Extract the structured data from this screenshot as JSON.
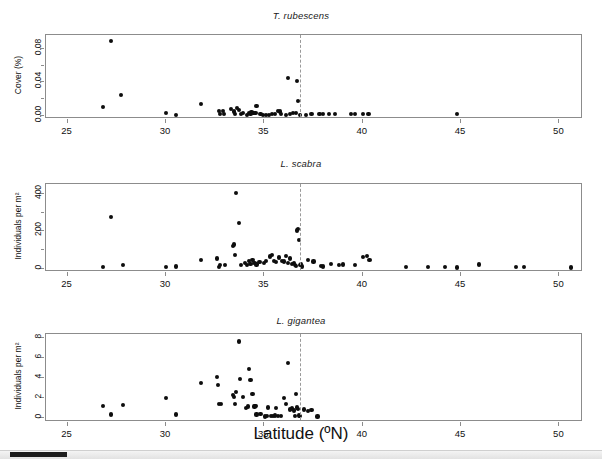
{
  "figure": {
    "xaxis_title": "Latitude (ºN)",
    "dashed_line_color": "#9a9a9a",
    "point_color": "#0d0d0d",
    "frame_color": "#8c8c8c",
    "background": "#ffffff"
  },
  "scrollbar": {
    "name": "horizontal-scrollbar",
    "thumb_color": "#1c1c1c",
    "track_color": "#e2e2e2"
  },
  "chart_data": [
    {
      "type": "scatter",
      "title": "T. rubescens",
      "xlabel": "Latitude (ºN)",
      "ylabel": "Cover (%)",
      "xlim": [
        23.9,
        51.2
      ],
      "ylim": [
        -0.004,
        0.097
      ],
      "xticks": [
        25,
        30,
        35,
        40,
        45,
        50
      ],
      "xticklabels": [
        "25",
        "30",
        "35",
        "40",
        "45",
        "50"
      ],
      "yticks": [
        0.0,
        0.02,
        0.04,
        0.06,
        0.08
      ],
      "yticklabels": [
        "0.00",
        "",
        "0.04",
        "",
        "0.08"
      ],
      "grid": false,
      "legend": "none",
      "annotations": [
        {
          "type": "vline",
          "x": 36.8,
          "style": "dashed",
          "color": "#9a9a9a"
        }
      ],
      "points": [
        [
          26.8,
          0.01
        ],
        [
          27.2,
          0.09
        ],
        [
          27.7,
          0.025
        ],
        [
          30.0,
          0.003
        ],
        [
          30.5,
          0.001
        ],
        [
          31.8,
          0.014
        ],
        [
          32.7,
          0.006
        ],
        [
          32.75,
          0.002
        ],
        [
          32.9,
          0.006
        ],
        [
          32.95,
          0.002
        ],
        [
          33.3,
          0.008
        ],
        [
          33.45,
          0.005
        ],
        [
          33.5,
          0.002
        ],
        [
          33.6,
          0.009
        ],
        [
          33.7,
          0.007
        ],
        [
          33.8,
          0.002
        ],
        [
          33.9,
          0.003
        ],
        [
          34.1,
          0.001
        ],
        [
          34.2,
          0.003
        ],
        [
          34.3,
          0.002
        ],
        [
          34.35,
          0.004
        ],
        [
          34.45,
          0.003
        ],
        [
          34.55,
          0.003
        ],
        [
          34.6,
          0.012
        ],
        [
          34.8,
          0.002
        ],
        [
          34.95,
          0.001
        ],
        [
          35.1,
          0.001
        ],
        [
          35.25,
          0.001
        ],
        [
          35.4,
          0.002
        ],
        [
          35.55,
          0.002
        ],
        [
          35.7,
          0.006
        ],
        [
          35.8,
          0.005
        ],
        [
          35.85,
          0.002
        ],
        [
          36.1,
          0.001
        ],
        [
          36.2,
          0.045
        ],
        [
          36.3,
          0.002
        ],
        [
          36.45,
          0.003
        ],
        [
          36.6,
          0.003
        ],
        [
          36.65,
          0.042
        ],
        [
          36.7,
          0.018
        ],
        [
          36.8,
          0.001
        ],
        [
          37.1,
          0.001
        ],
        [
          37.4,
          0.002
        ],
        [
          37.8,
          0.002
        ],
        [
          38.0,
          0.002
        ],
        [
          38.3,
          0.002
        ],
        [
          38.6,
          0.002
        ],
        [
          39.4,
          0.002
        ],
        [
          39.6,
          0.002
        ],
        [
          40.0,
          0.002
        ],
        [
          40.3,
          0.002
        ],
        [
          44.8,
          0.002
        ]
      ]
    },
    {
      "type": "scatter",
      "title": "L. scabra",
      "xlabel": "Latitude (ºN)",
      "ylabel": "Individuals per m²",
      "xlim": [
        23.9,
        51.2
      ],
      "ylim": [
        -18,
        455
      ],
      "xticks": [
        25,
        30,
        35,
        40,
        45,
        50
      ],
      "xticklabels": [
        "25",
        "30",
        "35",
        "40",
        "45",
        "50"
      ],
      "yticks": [
        0,
        100,
        200,
        300,
        400
      ],
      "yticklabels": [
        "0",
        "",
        "200",
        "",
        "400"
      ],
      "grid": false,
      "legend": "none",
      "annotations": [
        {
          "type": "vline",
          "x": 36.8,
          "style": "dashed",
          "color": "#9a9a9a"
        }
      ],
      "points": [
        [
          26.8,
          10
        ],
        [
          27.2,
          277
        ],
        [
          27.8,
          20
        ],
        [
          30.0,
          10
        ],
        [
          30.5,
          12
        ],
        [
          31.8,
          45
        ],
        [
          32.6,
          55
        ],
        [
          32.7,
          10
        ],
        [
          32.75,
          18
        ],
        [
          33.0,
          20
        ],
        [
          33.4,
          120
        ],
        [
          33.45,
          130
        ],
        [
          33.5,
          75
        ],
        [
          33.55,
          405
        ],
        [
          33.7,
          245
        ],
        [
          33.8,
          20
        ],
        [
          34.0,
          30
        ],
        [
          34.1,
          18
        ],
        [
          34.2,
          40
        ],
        [
          34.3,
          25
        ],
        [
          34.4,
          45
        ],
        [
          34.5,
          30
        ],
        [
          34.6,
          22
        ],
        [
          34.75,
          35
        ],
        [
          35.0,
          30
        ],
        [
          35.1,
          40
        ],
        [
          35.3,
          65
        ],
        [
          35.4,
          75
        ],
        [
          35.5,
          40
        ],
        [
          35.6,
          35
        ],
        [
          35.75,
          60
        ],
        [
          35.9,
          42
        ],
        [
          36.0,
          38
        ],
        [
          36.1,
          70
        ],
        [
          36.2,
          30
        ],
        [
          36.3,
          55
        ],
        [
          36.4,
          25
        ],
        [
          36.5,
          30
        ],
        [
          36.55,
          20
        ],
        [
          36.6,
          15
        ],
        [
          36.65,
          205
        ],
        [
          36.7,
          215
        ],
        [
          36.75,
          155
        ],
        [
          36.8,
          20
        ],
        [
          36.85,
          25
        ],
        [
          36.9,
          12
        ],
        [
          37.2,
          45
        ],
        [
          37.5,
          38
        ],
        [
          37.9,
          15
        ],
        [
          38.0,
          12
        ],
        [
          38.4,
          25
        ],
        [
          38.8,
          20
        ],
        [
          39.0,
          22
        ],
        [
          39.6,
          20
        ],
        [
          40.0,
          62
        ],
        [
          40.2,
          70
        ],
        [
          40.35,
          45
        ],
        [
          42.2,
          10
        ],
        [
          43.3,
          8
        ],
        [
          44.2,
          8
        ],
        [
          44.8,
          6
        ],
        [
          45.9,
          22
        ],
        [
          47.8,
          8
        ],
        [
          48.2,
          8
        ],
        [
          50.6,
          6
        ]
      ]
    },
    {
      "type": "scatter",
      "title": "L. gigantea",
      "xlabel": "Latitude (ºN)",
      "ylabel": "Individuals per m²",
      "xlim": [
        23.9,
        51.2
      ],
      "ylim": [
        -0.35,
        8.4
      ],
      "xticks": [
        25,
        30,
        35,
        40,
        45,
        50
      ],
      "xticklabels": [
        "25",
        "30",
        "35",
        "40",
        "45",
        "50"
      ],
      "yticks": [
        0,
        2,
        4,
        6,
        8
      ],
      "yticklabels": [
        "0",
        "2",
        "4",
        "6",
        "8"
      ],
      "grid": false,
      "legend": "none",
      "annotations": [
        {
          "type": "vline",
          "x": 36.8,
          "style": "dashed",
          "color": "#9a9a9a"
        }
      ],
      "points": [
        [
          26.8,
          1.25
        ],
        [
          27.2,
          0.4
        ],
        [
          27.8,
          1.35
        ],
        [
          30.0,
          2.0
        ],
        [
          30.5,
          0.4
        ],
        [
          31.8,
          3.55
        ],
        [
          32.6,
          4.15
        ],
        [
          32.65,
          3.35
        ],
        [
          32.7,
          1.4
        ],
        [
          32.8,
          1.4
        ],
        [
          33.4,
          2.35
        ],
        [
          33.45,
          2.15
        ],
        [
          33.5,
          1.4
        ],
        [
          33.55,
          2.6
        ],
        [
          33.7,
          7.65
        ],
        [
          33.75,
          3.9
        ],
        [
          33.9,
          2.1
        ],
        [
          34.05,
          1.05
        ],
        [
          34.15,
          1.2
        ],
        [
          34.2,
          4.95
        ],
        [
          34.3,
          3.8
        ],
        [
          34.4,
          2.45
        ],
        [
          34.5,
          1.2
        ],
        [
          34.55,
          1.25
        ],
        [
          34.6,
          0.4
        ],
        [
          34.8,
          0.45
        ],
        [
          35.05,
          0.2
        ],
        [
          35.15,
          0.25
        ],
        [
          35.2,
          1.1
        ],
        [
          35.35,
          0.25
        ],
        [
          35.45,
          0.25
        ],
        [
          35.55,
          0.3
        ],
        [
          35.6,
          1.05
        ],
        [
          35.7,
          0.25
        ],
        [
          35.85,
          0.25
        ],
        [
          36.0,
          2.0
        ],
        [
          36.1,
          1.4
        ],
        [
          36.2,
          5.5
        ],
        [
          36.3,
          0.9
        ],
        [
          36.4,
          1.0
        ],
        [
          36.5,
          0.8
        ],
        [
          36.55,
          0.25
        ],
        [
          36.6,
          2.45
        ],
        [
          36.65,
          1.1
        ],
        [
          36.7,
          0.95
        ],
        [
          36.75,
          0.3
        ],
        [
          36.8,
          0.25
        ],
        [
          37.0,
          0.9
        ],
        [
          37.2,
          0.75
        ],
        [
          37.4,
          0.85
        ],
        [
          37.7,
          0.2
        ]
      ]
    }
  ]
}
